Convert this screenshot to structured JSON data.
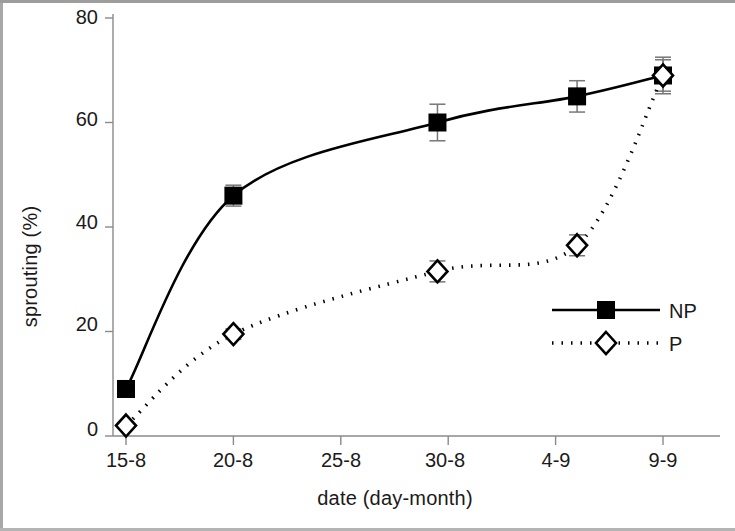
{
  "chart_data": {
    "type": "line",
    "title": "",
    "xlabel": "date (day-month)",
    "ylabel": "sprouting (%)",
    "categories": [
      "15-8",
      "20-8",
      "25-8",
      "30-8",
      "4-9",
      "9-9"
    ],
    "x_tick_labels": [
      "15-8",
      "20-8",
      "25-8",
      "30-8",
      "4-9",
      "9-9"
    ],
    "y_tick_labels": [
      "0",
      "20",
      "40",
      "60",
      "80"
    ],
    "y_ticks": [
      0,
      20,
      40,
      60,
      80
    ],
    "ylim": [
      0,
      80
    ],
    "xlim": [
      0,
      5
    ],
    "grid": false,
    "legend_position": "center-right",
    "series": [
      {
        "name": "NP",
        "marker": "filled-square",
        "line_style": "solid",
        "color": "#000000",
        "x": [
          0,
          1,
          2.9,
          4.2,
          5
        ],
        "values": [
          9,
          46,
          60,
          65,
          69
        ],
        "errors": [
          1.5,
          2.0,
          3.5,
          3.0,
          3.0
        ]
      },
      {
        "name": "P",
        "marker": "open-diamond",
        "line_style": "dotted",
        "color": "#000000",
        "x": [
          0,
          1,
          2.9,
          4.2,
          5
        ],
        "values": [
          2,
          19.5,
          31.5,
          36.5,
          69
        ],
        "errors": [
          0.5,
          1.0,
          2.0,
          2.0,
          3.5
        ]
      }
    ]
  },
  "legend": {
    "entries": [
      {
        "label": "NP"
      },
      {
        "label": "P"
      }
    ]
  },
  "axes": {
    "x_title": "date (day-month)",
    "y_title": "sprouting (%)"
  }
}
